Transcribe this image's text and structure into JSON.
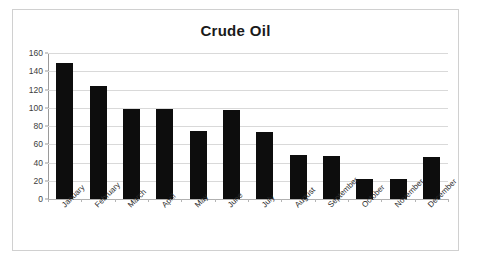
{
  "chart_data": {
    "type": "bar",
    "title": "Crude Oil",
    "xlabel": "",
    "ylabel": "",
    "categories": [
      "January",
      "February",
      "March",
      "April",
      "May",
      "June",
      "July",
      "August",
      "September",
      "October",
      "November",
      "December"
    ],
    "values": [
      149,
      124,
      99,
      99,
      74,
      98,
      73,
      48,
      47,
      22,
      22,
      46
    ],
    "series": [
      {
        "name": "Crude Oil",
        "values": [
          149,
          124,
          99,
          99,
          74,
          98,
          73,
          48,
          47,
          22,
          22,
          46
        ],
        "color": "#0d0d0d"
      }
    ],
    "ylim": [
      0,
      160
    ],
    "y_ticks": [
      0,
      20,
      40,
      60,
      80,
      100,
      120,
      140,
      160
    ],
    "y_tick_labels": [
      "0",
      "20",
      "40",
      "60",
      "80",
      "100",
      "120",
      "140",
      "160"
    ],
    "grid": true,
    "grid_axis": "y",
    "legend": false,
    "legend_position": "none",
    "x_tick_label_rotation": -45,
    "bar_color": "#0d0d0d",
    "gridline_color": "#d9d9d9",
    "axis_color": "#9a9a9a",
    "border_color": "#d0d0d0",
    "background": "#ffffff"
  }
}
